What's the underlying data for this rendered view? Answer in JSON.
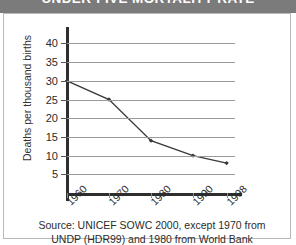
{
  "figure": {
    "title": "UNDER-FIVE MORTALITY RATE",
    "title_band_color": "#7b7b7b",
    "background": "#ffffff",
    "border_color": "#b9b9b9"
  },
  "source_note": {
    "line1": "Source: UNICEF SOWC 2000, except 1970 from",
    "line2": "UNDP (HDR99) and 1980 from World Bank"
  },
  "chart_data": {
    "type": "line",
    "title": "UNDER-FIVE MORTALITY RATE",
    "xlabel": "",
    "ylabel": "Deaths per thousand births",
    "categories": [
      "1960",
      "1970",
      "1980",
      "1990",
      "1998"
    ],
    "x": [
      1960,
      1970,
      1980,
      1990,
      1998
    ],
    "values": [
      30,
      25,
      14,
      10,
      8
    ],
    "series": [
      {
        "name": "Under-five mortality rate",
        "values": [
          30,
          25,
          14,
          10,
          8
        ],
        "color": "#3a3a3a",
        "marker": "diamond"
      }
    ],
    "ylim": [
      0,
      42
    ],
    "yticks": [
      5,
      10,
      15,
      20,
      25,
      30,
      35,
      40
    ],
    "ytick_labels": [
      "5",
      "10",
      "15",
      "20",
      "25",
      "30",
      "35",
      "40"
    ],
    "xtick_labels": [
      "1960",
      "1970",
      "1980",
      "1990",
      "1998"
    ],
    "xtick_rotation": -45,
    "grid": "horizontal",
    "gridline_color": "#9a9a9a",
    "axis_color": "#2e2e2e",
    "legend": "none"
  }
}
